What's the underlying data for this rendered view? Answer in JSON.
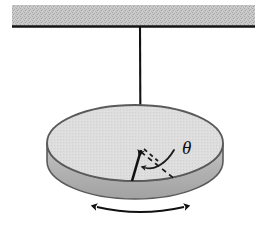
{
  "figure": {
    "name": "pendulum-disk-diagram",
    "caption": "",
    "background_color": "#ffffff"
  },
  "ceiling": {
    "name": "ceiling-support",
    "label": "",
    "fill_color": "#c6c6c6",
    "edge_color": "#1a1a1a",
    "x": 12,
    "y": 5,
    "width": 243,
    "height": 21
  },
  "string": {
    "name": "suspension-string",
    "label": "",
    "color": "#111111",
    "x": 140,
    "y_top": 27,
    "y_bottom": 147
  },
  "disk": {
    "name": "rotating-disk",
    "label": "",
    "top_fill": "#dcdcdc",
    "side_fill": "#b4b4b4",
    "outline_color": "#4d4d4d",
    "center_x": 135,
    "center_y": 143,
    "radius_x": 88,
    "radius_y": 38,
    "thickness": 18
  },
  "radius_line": {
    "name": "disk-radius-line",
    "label": "",
    "color": "#111111",
    "x1": 132,
    "y1": 181,
    "x2": 140,
    "y2": 147
  },
  "reference_line": {
    "name": "angle-reference-dashed-line",
    "label": "",
    "color": "#1a1a1a",
    "style": "dashed",
    "x1": 140,
    "y1": 150,
    "x2": 175,
    "y2": 178
  },
  "angle": {
    "name": "angle-theta",
    "symbol": "θ",
    "arc_color": "#1a1a1a",
    "label_x": 182,
    "label_y": 154
  },
  "oscillation_arrow": {
    "name": "oscillation-double-arrow",
    "label": "",
    "color": "#111111",
    "x_left": 95,
    "x_right": 186,
    "y": 208
  }
}
